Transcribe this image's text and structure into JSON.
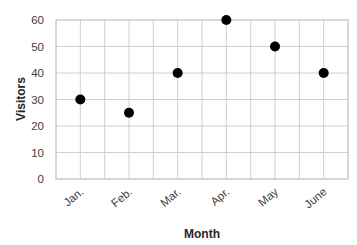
{
  "chart_data": {
    "type": "scatter",
    "title": "",
    "categories": [
      "Jan.",
      "Feb.",
      "Mar.",
      "Apr.",
      "May",
      "June"
    ],
    "series": [
      {
        "name": "Visitors",
        "values": [
          30,
          25,
          40,
          60,
          50,
          40
        ],
        "color": "#000000"
      }
    ],
    "xlabel": "Month",
    "ylabel": "Visitors",
    "ylim": [
      0,
      60
    ],
    "yticks": [
      0,
      10,
      20,
      30,
      40,
      50,
      60
    ],
    "grid": true,
    "legend": "none"
  }
}
